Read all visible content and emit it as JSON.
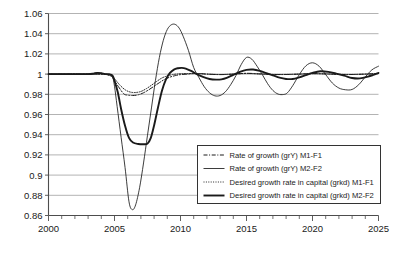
{
  "chart_data": {
    "type": "line",
    "title": "",
    "subtitle": "",
    "xlabel": "",
    "ylabel": "",
    "xlim": [
      2000,
      2025
    ],
    "ylim": [
      0.86,
      1.06
    ],
    "grid": true,
    "grid_axis": "y",
    "legend_position": "inside-bottom-right",
    "y_ticks": [
      "1.06",
      "1.04",
      "1.02",
      "1",
      "0.98",
      "0.96",
      "0.94",
      "0.92",
      "0.9",
      "0.88",
      "0.86"
    ],
    "y_tick_values": [
      1.06,
      1.04,
      1.02,
      1.0,
      0.98,
      0.96,
      0.94,
      0.92,
      0.9,
      0.88,
      0.86
    ],
    "x_ticks": [
      "2000",
      "2005",
      "2010",
      "2015",
      "2020",
      "2025"
    ],
    "x_tick_values": [
      2000,
      2005,
      2010,
      2015,
      2020,
      2025
    ],
    "x_minor_tick_step": 1,
    "series": [
      {
        "name": "Rate of growth (grY) M1-F1",
        "style": "dash-dot",
        "width": 1.0,
        "color": "#1a1a1a",
        "x": [
          2000,
          2001,
          2002,
          2003,
          2003.5,
          2004,
          2004.4,
          2004.8,
          2005.0,
          2005.3,
          2005.7,
          2006.0,
          2006.4,
          2006.8,
          2007.2,
          2007.6,
          2008.0,
          2008.4,
          2008.8,
          2009.2,
          2009.6,
          2010.0,
          2010.5,
          2011.0,
          2011.5,
          2012,
          2013,
          2014,
          2015,
          2016,
          2017,
          2018,
          2019,
          2020,
          2021,
          2022,
          2023,
          2024,
          2025
        ],
        "y": [
          1.0,
          1.0,
          1.0,
          1.0,
          1.0,
          1.0,
          0.9995,
          0.9975,
          0.9935,
          0.9875,
          0.9805,
          0.9792,
          0.9788,
          0.9795,
          0.9815,
          0.9845,
          0.988,
          0.9915,
          0.9948,
          0.997,
          0.9985,
          0.9995,
          1.0,
          1.0005,
          1.0005,
          1.0,
          0.9995,
          1.0,
          1.0008,
          1.0002,
          0.9996,
          0.9996,
          1.0,
          1.0005,
          1.0002,
          0.9997,
          0.9996,
          1.0,
          1.0006
        ]
      },
      {
        "name": "Rate of growth (grY) M2-F2",
        "style": "solid",
        "width": 0.85,
        "color": "#1a1a1a",
        "x": [
          2000,
          2001,
          2002,
          2003,
          2003.4,
          2003.7,
          2004.0,
          2004.3,
          2004.6,
          2004.85,
          2005.0,
          2005.2,
          2005.5,
          2005.8,
          2006.1,
          2006.35,
          2006.6,
          2006.9,
          2007.2,
          2007.5,
          2007.8,
          2008.1,
          2008.4,
          2008.7,
          2009.0,
          2009.3,
          2009.6,
          2009.9,
          2010.2,
          2010.6,
          2011.0,
          2011.4,
          2011.8,
          2012.2,
          2012.6,
          2013.0,
          2013.4,
          2013.8,
          2014.2,
          2014.6,
          2015.0,
          2015.4,
          2015.8,
          2016.2,
          2016.6,
          2017.0,
          2017.4,
          2017.8,
          2018.1,
          2018.5,
          2019.0,
          2019.5,
          2020.0,
          2020.5,
          2021.0,
          2021.5,
          2022.0,
          2022.5,
          2023.0,
          2023.5,
          2024.0,
          2024.5,
          2025.0
        ],
        "y": [
          1.0,
          1.0,
          1.0,
          1.0,
          1.0005,
          1.0012,
          1.0008,
          1.0,
          0.9995,
          0.9975,
          0.988,
          0.968,
          0.9375,
          0.9075,
          0.8735,
          0.8658,
          0.8705,
          0.8875,
          0.912,
          0.9395,
          0.9665,
          0.9935,
          1.0165,
          1.0335,
          1.0442,
          1.0488,
          1.0492,
          1.0455,
          1.0375,
          1.0235,
          1.0065,
          0.9965,
          0.9875,
          0.9815,
          0.9785,
          0.9788,
          0.9825,
          0.9895,
          0.9985,
          1.0095,
          1.0165,
          1.0148,
          1.0078,
          0.9995,
          0.9905,
          0.9838,
          0.9802,
          0.9798,
          0.9815,
          0.9885,
          0.9995,
          1.0082,
          1.0112,
          1.0078,
          0.9995,
          0.9912,
          0.9862,
          0.9845,
          0.9848,
          0.9895,
          0.9972,
          1.0042,
          1.0078
        ]
      },
      {
        "name": "Desired growth rate in capital (grkd) M1-F1",
        "style": "dotted",
        "width": 0.95,
        "color": "#1a1a1a",
        "x": [
          2000,
          2001,
          2002,
          2003,
          2003.5,
          2004,
          2004.4,
          2004.8,
          2005.0,
          2005.4,
          2005.8,
          2006.2,
          2006.6,
          2007.0,
          2007.4,
          2007.8,
          2008.2,
          2008.6,
          2009.0,
          2009.4,
          2009.8,
          2010.2,
          2010.8,
          2011.4,
          2012,
          2013,
          2014,
          2015,
          2016,
          2017,
          2018,
          2019,
          2020,
          2021,
          2022,
          2023,
          2024,
          2025
        ],
        "y": [
          1.0,
          1.0,
          1.0,
          1.0,
          1.0,
          1.0,
          0.9998,
          0.9982,
          0.9955,
          0.9892,
          0.9845,
          0.9822,
          0.9818,
          0.9828,
          0.9855,
          0.989,
          0.9928,
          0.9962,
          0.9982,
          0.9995,
          1.0002,
          1.0005,
          1.0006,
          1.0005,
          1.0,
          0.9996,
          1.0,
          1.0006,
          1.0002,
          0.9997,
          0.9997,
          1.0,
          1.0004,
          1.0002,
          0.9998,
          0.9997,
          1.0,
          1.0005
        ]
      },
      {
        "name": "Desired growth rate in capital (grkd) M2-F2",
        "style": "solid",
        "width": 1.9,
        "color": "#1a1a1a",
        "x": [
          2000,
          2001,
          2002,
          2003,
          2003.4,
          2003.7,
          2004.0,
          2004.3,
          2004.6,
          2004.85,
          2005.0,
          2005.25,
          2005.5,
          2005.8,
          2006.1,
          2006.4,
          2006.8,
          2007.2,
          2007.5,
          2007.75,
          2008.0,
          2008.3,
          2008.6,
          2008.9,
          2009.2,
          2009.5,
          2009.8,
          2010.1,
          2010.4,
          2010.8,
          2011.2,
          2011.7,
          2012.2,
          2012.7,
          2013.1,
          2013.5,
          2014.0,
          2014.5,
          2015.0,
          2015.5,
          2016.0,
          2016.5,
          2017.0,
          2017.5,
          2018.0,
          2018.5,
          2019.0,
          2019.5,
          2020.0,
          2020.6,
          2021.2,
          2021.8,
          2022.4,
          2023.0,
          2023.6,
          2024.2,
          2024.6,
          2025.0
        ],
        "y": [
          1.0,
          1.0,
          1.0,
          1.0,
          1.0005,
          1.0012,
          1.0008,
          1.0,
          0.9998,
          0.9985,
          0.9935,
          0.982,
          0.9655,
          0.9488,
          0.9368,
          0.9322,
          0.9308,
          0.9305,
          0.9312,
          0.9368,
          0.9492,
          0.9672,
          0.9838,
          0.9948,
          1.0012,
          1.0045,
          1.0058,
          1.0062,
          1.0055,
          1.0032,
          1.0002,
          0.9972,
          0.9952,
          0.9945,
          0.9948,
          0.9962,
          0.9992,
          1.0022,
          1.0042,
          1.0045,
          1.0032,
          1.001,
          0.9988,
          0.9965,
          0.9952,
          0.9952,
          0.9968,
          0.999,
          1.0012,
          1.0028,
          1.0022,
          1.0005,
          0.9985,
          0.9962,
          0.9958,
          0.9975,
          0.9992,
          1.0012
        ]
      }
    ]
  },
  "legend": {
    "items": [
      {
        "label": "Rate of growth (grY) M1-F1",
        "style": "dash-dot"
      },
      {
        "label": "Rate of growth (grY) M2-F2",
        "style": "solid-thin"
      },
      {
        "label": "Desired growth rate in capital (grkd) M1-F1",
        "style": "dotted"
      },
      {
        "label": "Desired growth rate in capital (grkd) M2-F2",
        "style": "solid-thick"
      }
    ]
  },
  "colors": {
    "line": "#1a1a1a",
    "grid": "#aaaaaa",
    "axis": "#4d4d4d",
    "background": "#ffffff"
  }
}
